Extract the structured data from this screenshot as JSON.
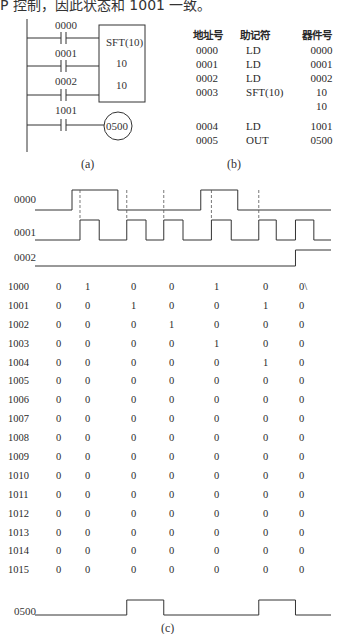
{
  "header_text": "P 控制，因此状态和 1001 一致。",
  "ladder": {
    "contacts": [
      "0000",
      "0001",
      "0002",
      "1001"
    ],
    "block_name": "SFT(10)",
    "block_operands": [
      "10",
      "10"
    ],
    "output_coil": "0500",
    "caption": "(a)"
  },
  "program": {
    "headers": [
      "地址号",
      "助记符",
      "器件号"
    ],
    "rows": [
      {
        "addr": "0000",
        "mnemonic": "LD",
        "operand": "0000"
      },
      {
        "addr": "0001",
        "mnemonic": "LD",
        "operand": "0001"
      },
      {
        "addr": "0002",
        "mnemonic": "LD",
        "operand": "0002"
      },
      {
        "addr": "0003",
        "mnemonic": "SFT(10)",
        "operand": "10"
      },
      {
        "addr": "",
        "mnemonic": "",
        "operand": "10"
      },
      {
        "addr": "0004",
        "mnemonic": "LD",
        "operand": "1001"
      },
      {
        "addr": "0005",
        "mnemonic": "OUT",
        "operand": "0500"
      }
    ],
    "caption": "(b)"
  },
  "timing": {
    "caption": "(c)",
    "signals": [
      {
        "name": "0000",
        "transitions": [
          0,
          1,
          0,
          1,
          0
        ],
        "edges_t": [
          0,
          0.125,
          0.28,
          0.56,
          0.685,
          1.0
        ]
      },
      {
        "name": "0001",
        "transitions": [
          0,
          1,
          0,
          1,
          0,
          1,
          0,
          1,
          0,
          1,
          0,
          1,
          0
        ],
        "edges_t": [
          0,
          0.152,
          0.217,
          0.31,
          0.375,
          0.435,
          0.5,
          0.596,
          0.663,
          0.756,
          0.815,
          0.88,
          0.942,
          1.0
        ]
      },
      {
        "name": "0002",
        "transitions": [
          0,
          1
        ],
        "edges_t": [
          0,
          0.88,
          1.0
        ]
      },
      {
        "name": "0500",
        "transitions": [
          0,
          1,
          0,
          1,
          0
        ],
        "edges_t": [
          0,
          0.31,
          0.435,
          0.756,
          0.88,
          1.0
        ]
      }
    ],
    "dashed_markers_t": [
      0.152,
      0.31,
      0.435,
      0.596,
      0.756
    ],
    "shift_register": {
      "rows": [
        {
          "bit": "1000",
          "values": [
            "0",
            "1",
            "0",
            "0",
            "1",
            "0",
            "0\\"
          ]
        },
        {
          "bit": "1001",
          "values": [
            "0",
            "0",
            "1",
            "0",
            "0",
            "1",
            "0"
          ]
        },
        {
          "bit": "1002",
          "values": [
            "0",
            "0",
            "0",
            "1",
            "0",
            "0",
            "0"
          ]
        },
        {
          "bit": "1003",
          "values": [
            "0",
            "0",
            "0",
            "0",
            "1",
            "0",
            "0"
          ]
        },
        {
          "bit": "1004",
          "values": [
            "0",
            "0",
            "0",
            "0",
            "0",
            "1",
            "0"
          ]
        },
        {
          "bit": "1005",
          "values": [
            "0",
            "0",
            "0",
            "0",
            "0",
            "0",
            "0"
          ]
        },
        {
          "bit": "1006",
          "values": [
            "0",
            "0",
            "0",
            "0",
            "0",
            "0",
            "0"
          ]
        },
        {
          "bit": "1007",
          "values": [
            "0",
            "0",
            "0",
            "0",
            "0",
            "0",
            "0"
          ]
        },
        {
          "bit": "1008",
          "values": [
            "0",
            "0",
            "0",
            "0",
            "0",
            "0",
            "0"
          ]
        },
        {
          "bit": "1009",
          "values": [
            "0",
            "0",
            "0",
            "0",
            "0",
            "0",
            "0"
          ]
        },
        {
          "bit": "1010",
          "values": [
            "0",
            "0",
            "0",
            "0",
            "0",
            "0",
            "0"
          ]
        },
        {
          "bit": "1011",
          "values": [
            "0",
            "0",
            "0",
            "0",
            "0",
            "0",
            "0"
          ]
        },
        {
          "bit": "1012",
          "values": [
            "0",
            "0",
            "0",
            "0",
            "0",
            "0",
            "0"
          ]
        },
        {
          "bit": "1013",
          "values": [
            "0",
            "0",
            "0",
            "0",
            "0",
            "0",
            "0"
          ]
        },
        {
          "bit": "1014",
          "values": [
            "0",
            "0",
            "0",
            "0",
            "0",
            "0",
            "0"
          ]
        },
        {
          "bit": "1015",
          "values": [
            "0",
            "0",
            "0",
            "0",
            "0",
            "0",
            "0"
          ]
        }
      ]
    }
  }
}
